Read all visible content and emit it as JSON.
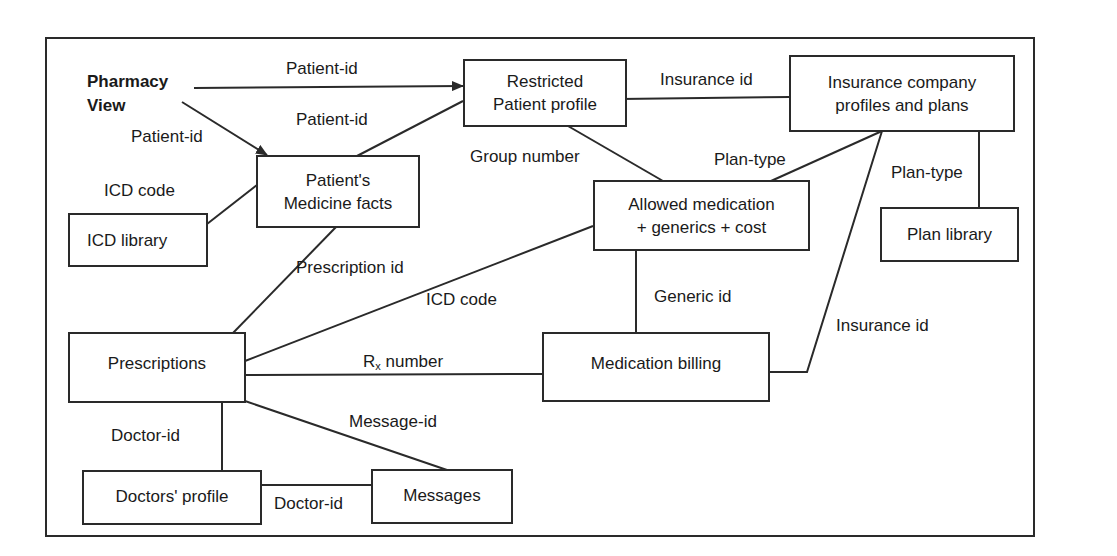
{
  "diagram": {
    "title": "Pharmacy\nView",
    "nodes": {
      "restricted_profile": "Restricted\nPatient profile",
      "insurance_company": "Insurance company\nprofiles and plans",
      "medicine_facts": "Patient's\nMedicine facts",
      "icd_library": "ICD library",
      "allowed_medication": "Allowed medication\n+ generics + cost",
      "plan_library": "Plan library",
      "prescriptions": "Prescriptions",
      "medication_billing": "Medication billing",
      "doctors_profile": "Doctors' profile",
      "messages": "Messages"
    },
    "edges": {
      "view_to_restricted": "Patient-id",
      "view_to_facts": "Patient-id",
      "facts_to_restricted": "Patient-id",
      "restricted_to_insurance": "Insurance id",
      "restricted_to_allowed": "Group number",
      "insurance_to_allowed": "Plan-type",
      "insurance_to_plan_library": "Plan-type",
      "icd_to_facts": "ICD code",
      "facts_to_prescriptions": "Prescription id",
      "prescriptions_to_allowed": "ICD code",
      "allowed_to_billing": "Generic id",
      "insurance_to_billing": "Insurance id",
      "prescriptions_to_billing_main": "R",
      "prescriptions_to_billing_sub": "x",
      "prescriptions_to_billing_tail": " number",
      "prescriptions_to_doctors": "Doctor-id",
      "prescriptions_to_messages": "Message-id",
      "doctors_to_messages": "Doctor-id"
    },
    "colors": {
      "line": "#2a2a2a",
      "text": "#1a1a1a",
      "background": "#ffffff"
    }
  }
}
